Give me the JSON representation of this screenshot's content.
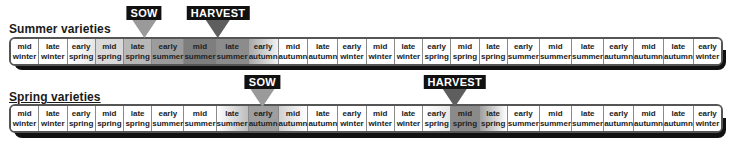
{
  "months": [
    [
      "mid",
      "winter"
    ],
    [
      "late",
      "winter"
    ],
    [
      "early",
      "spring"
    ],
    [
      "mid",
      "spring"
    ],
    [
      "late",
      "spring"
    ],
    [
      "early",
      "summer"
    ],
    [
      "mid",
      "summer"
    ],
    [
      "late",
      "summer"
    ],
    [
      "early",
      "autumn"
    ],
    [
      "mid",
      "autumn"
    ],
    [
      "late",
      "autumn"
    ],
    [
      "early",
      "winter"
    ],
    [
      "mid",
      "winter"
    ],
    [
      "late",
      "winter"
    ],
    [
      "early",
      "spring"
    ],
    [
      "mid",
      "spring"
    ],
    [
      "late",
      "spring"
    ],
    [
      "early",
      "summer"
    ],
    [
      "mid",
      "summer"
    ],
    [
      "late",
      "summer"
    ],
    [
      "early",
      "autumn"
    ],
    [
      "mid",
      "autumn"
    ],
    [
      "late",
      "autumn"
    ],
    [
      "early",
      "winter"
    ]
  ],
  "rows": [
    {
      "title": "Summer varieties",
      "sow": {
        "label": "SOW",
        "cell_index": 4,
        "color": "#9a9a9a"
      },
      "harvest": {
        "label": "HARVEST",
        "cell_index": 6.5,
        "color": "#5e5e5e"
      },
      "shading": [
        "#ffffff",
        "#ffffff",
        "linear-gradient(90deg,#ffffff,#e6e6e6)",
        "#d9d9d9",
        "#b8b8b8",
        "#9c9c9c",
        "#7e7e7e",
        "#8c8c8c",
        "linear-gradient(90deg,#a8a8a8,#f2f2f2)",
        "#ffffff",
        "#ffffff",
        "#ffffff",
        "#ffffff",
        "#ffffff",
        "#ffffff",
        "#ffffff",
        "#ffffff",
        "#ffffff",
        "#ffffff",
        "#ffffff",
        "#ffffff",
        "#ffffff",
        "#ffffff",
        "#ffffff"
      ]
    },
    {
      "title": "Spring varieties",
      "sow": {
        "label": "SOW",
        "cell_index": 8,
        "color": "#9a9a9a"
      },
      "harvest": {
        "label": "HARVEST",
        "cell_index": 14.5,
        "color": "#5e5e5e"
      },
      "shading": [
        "#ffffff",
        "#ffffff",
        "#ffffff",
        "#ffffff",
        "#ffffff",
        "#ffffff",
        "#ffffff",
        "linear-gradient(90deg,#ffffff,#bdbdbd)",
        "#9e9e9e",
        "linear-gradient(90deg,#d0d0d0,#ffffff)",
        "#ffffff",
        "#ffffff",
        "#ffffff",
        "#ffffff",
        "linear-gradient(90deg,#ffffff,#e8e8e8)",
        "#8a8a8a",
        "linear-gradient(90deg,#a0a0a0,#ffffff)",
        "#ffffff",
        "#ffffff",
        "#ffffff",
        "#ffffff",
        "#ffffff",
        "#ffffff",
        "#ffffff"
      ]
    }
  ]
}
